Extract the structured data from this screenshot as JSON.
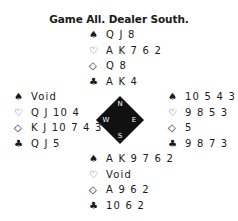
{
  "title": "Game All. Dealer South.",
  "suits": {
    "spades": "♠",
    "hearts": "♡",
    "diamonds": "◇",
    "clubs": "♣"
  },
  "compass": {
    "north": "N",
    "south": "S",
    "east": "E",
    "west": "W"
  },
  "hands": {
    "north": {
      "spades": "Q J 8",
      "hearts": "A K 7 6 2",
      "diamonds": "Q 8",
      "clubs": "A K 4"
    },
    "west": {
      "spades": "Void",
      "hearts": "Q J 10 4",
      "diamonds": "K J 10 7 4 3",
      "clubs": "Q J 5"
    },
    "east": {
      "spades": "10 5 4 3",
      "hearts": "9 8 5 3",
      "diamonds": "5",
      "clubs": "9 8 7 3"
    },
    "south": {
      "spades": "A K 9 7 6 2",
      "hearts": "Void",
      "diamonds": "A 9 6 2",
      "clubs": "10 6 2"
    }
  }
}
